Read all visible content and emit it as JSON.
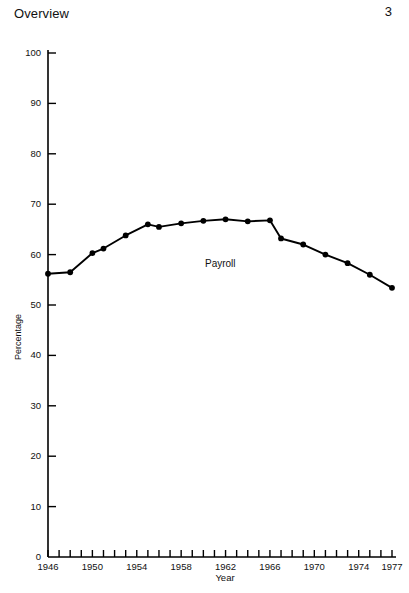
{
  "header": {
    "title": "Overview",
    "page_number": "3"
  },
  "chart_data": {
    "type": "line",
    "title": "",
    "xlabel": "Year",
    "ylabel": "Percentage",
    "xlim": [
      1946,
      1977
    ],
    "ylim": [
      0,
      100
    ],
    "grid": false,
    "legend": "none",
    "annotations": [
      {
        "text": "Payroll",
        "x": 1959,
        "y": 58
      }
    ],
    "y_ticks": [
      0,
      10,
      20,
      30,
      40,
      50,
      60,
      70,
      80,
      90,
      100
    ],
    "y_tick_labels": [
      "0",
      "10",
      "20",
      "30",
      "40",
      "50",
      "60",
      "70",
      "80",
      "90",
      "100"
    ],
    "x_ticks": [
      1946,
      1947,
      1948,
      1949,
      1950,
      1951,
      1952,
      1953,
      1954,
      1955,
      1956,
      1957,
      1958,
      1959,
      1960,
      1961,
      1962,
      1963,
      1964,
      1965,
      1966,
      1967,
      1968,
      1969,
      1970,
      1971,
      1972,
      1973,
      1974,
      1975,
      1976,
      1977
    ],
    "x_tick_labels": [
      "1946",
      "1950",
      "1954",
      "1958",
      "1962",
      "1966",
      "1970",
      "1974",
      "1977"
    ],
    "x_tick_label_values": [
      1946,
      1950,
      1954,
      1958,
      1962,
      1966,
      1970,
      1974,
      1977
    ],
    "series": [
      {
        "name": "Payroll",
        "color": "#000000",
        "marker": "circle",
        "x": [
          1946,
          1948,
          1950,
          1951,
          1953,
          1955,
          1956,
          1958,
          1960,
          1962,
          1964,
          1966,
          1967,
          1969,
          1971,
          1973,
          1975,
          1977
        ],
        "values": [
          56.2,
          56.5,
          60.3,
          61.2,
          63.8,
          66.0,
          65.5,
          66.2,
          66.7,
          67.0,
          66.6,
          66.8,
          63.2,
          62.0,
          60.0,
          58.3,
          56.0,
          53.4
        ]
      }
    ]
  }
}
